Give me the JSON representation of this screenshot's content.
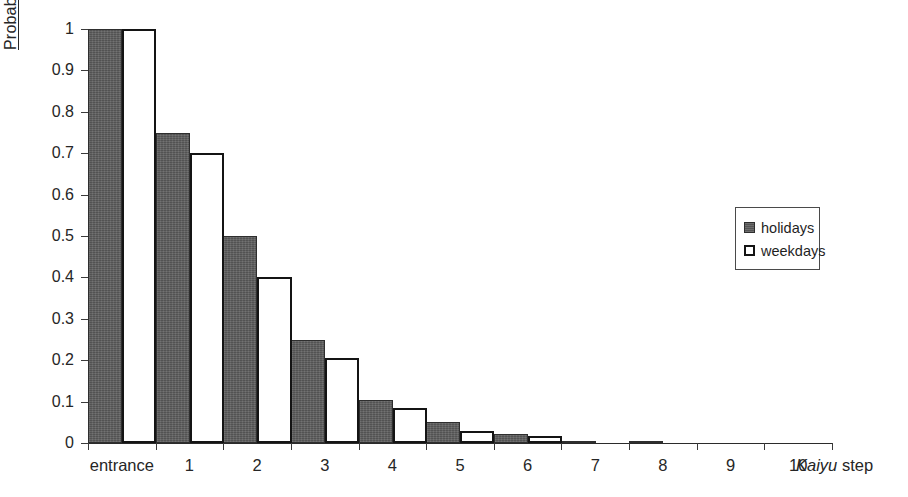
{
  "chart_data": {
    "type": "bar",
    "title": "",
    "subtitle": "",
    "xlabel": "Kaiyu step",
    "xlabel_italic_part": "Kaiyu",
    "xlabel_plain_part": "step",
    "ylabel": "Probability",
    "ylim": [
      0,
      1
    ],
    "ytick_labels": [
      "1",
      "0.9",
      "0.8",
      "0.7",
      "0.6",
      "0.5",
      "0.4",
      "0.3",
      "0.2",
      "0.1",
      "0"
    ],
    "ytick_values": [
      1,
      0.9,
      0.8,
      0.7,
      0.6,
      0.5,
      0.4,
      0.3,
      0.2,
      0.1,
      0
    ],
    "grid": false,
    "categories": [
      "entrance",
      "1",
      "2",
      "3",
      "4",
      "5",
      "6",
      "7",
      "8",
      "9",
      "10"
    ],
    "series": [
      {
        "name": "holidays",
        "color": "#5e5e5e",
        "values": [
          1,
          0.75,
          0.5,
          0.25,
          0.105,
          0.05,
          0.022,
          0.006,
          0.005,
          0,
          0
        ]
      },
      {
        "name": "weekdays",
        "color": "#ffffff",
        "border_color": "#141414",
        "values": [
          1,
          0.7,
          0.4,
          0.205,
          0.085,
          0.03,
          0.017,
          0,
          0,
          0,
          0
        ]
      }
    ],
    "legend": {
      "position": "right-middle",
      "entries": [
        {
          "label": "holidays",
          "swatch": "filled-gray-square"
        },
        {
          "label": "weekdays",
          "swatch": "outlined-white-square"
        }
      ]
    }
  }
}
